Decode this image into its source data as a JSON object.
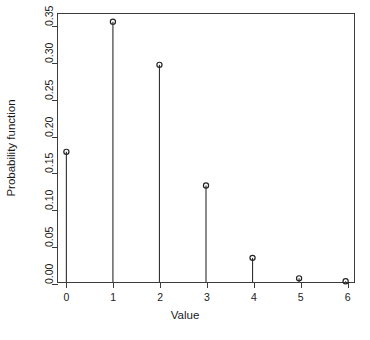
{
  "chart_data": {
    "type": "scatter",
    "plot_style": "stem-and-point probability mass function (R type='h' with points)",
    "title": "",
    "subtitle": "",
    "xlabel": "Value",
    "ylabel": "Probability function",
    "categories": [
      0,
      1,
      2,
      3,
      4,
      5,
      6
    ],
    "x": [
      0,
      1,
      2,
      3,
      4,
      5,
      6
    ],
    "values": [
      0.178,
      0.356,
      0.297,
      0.132,
      0.033,
      0.005,
      0.001
    ],
    "series": [
      {
        "name": "Probability function",
        "values": [
          0.178,
          0.356,
          0.297,
          0.132,
          0.033,
          0.005,
          0.001
        ]
      }
    ],
    "xlim": [
      -0.18,
      6.18
    ],
    "ylim": [
      0.0,
      0.3665
    ],
    "xticks": [
      0,
      1,
      2,
      3,
      4,
      5,
      6
    ],
    "xtick_labels": [
      "0",
      "1",
      "2",
      "3",
      "4",
      "5",
      "6"
    ],
    "yticks": [
      0.0,
      0.05,
      0.1,
      0.15,
      0.2,
      0.25,
      0.3,
      0.35
    ],
    "ytick_labels": [
      "0.00",
      "0.05",
      "0.10",
      "0.15",
      "0.20",
      "0.25",
      "0.30",
      "0.35"
    ],
    "grid": false,
    "legend": false,
    "legend_position": "none",
    "annotations": [],
    "colors": {
      "background": "#ffffff",
      "axis": "#3c3c3c",
      "stem": "#333333",
      "point_stroke": "#222222",
      "text": "#1a1a1a"
    },
    "point_marker": "open-circle",
    "baseline": 0.0
  },
  "caption_sliver": ""
}
